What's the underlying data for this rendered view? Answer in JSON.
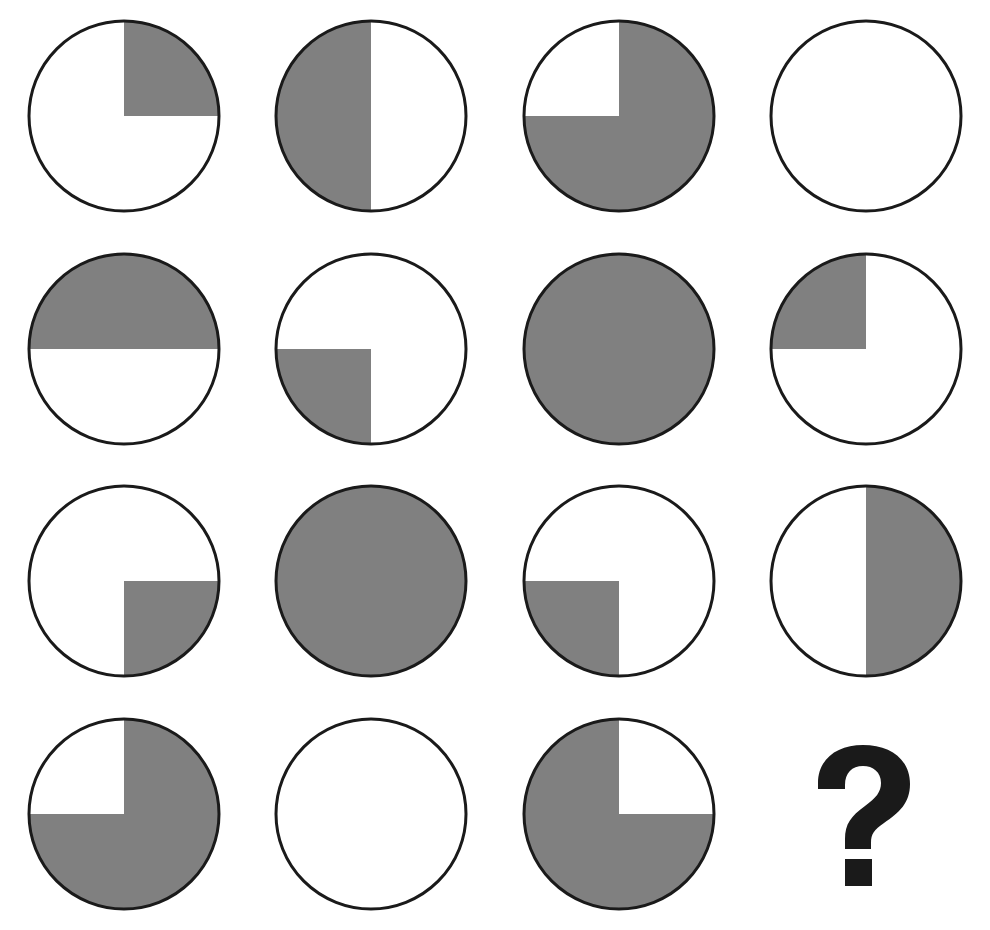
{
  "figure": {
    "type": "4x4 matrix of quartered circles with missing final element",
    "rows": 4,
    "columns": 4,
    "background_color": "#ffffff",
    "fill_color": "#808080",
    "outline_color": "#1a1a1a",
    "question_mark_color": "#1a1a1a",
    "circle_diameter_px": 190,
    "outline_width_px": 3
  },
  "legend": {
    "quadrant_order": [
      "top-left",
      "top-right",
      "bottom-right",
      "bottom-left"
    ],
    "filled_token": "filled",
    "empty_token": "empty"
  },
  "cells": [
    {
      "id": "r1c1",
      "row": 1,
      "col": 2,
      "kind": "circle",
      "label": "circle top-right quadrant shaded",
      "shaded_quadrants": [
        "top-right"
      ],
      "quadrants": {
        "top_left": false,
        "top_right": true,
        "bottom_right": false,
        "bottom_left": false
      },
      "shaded_count": 1
    },
    {
      "id": "r1c2",
      "row": 1,
      "col": 2,
      "kind": "circle",
      "label": "circle left half shaded",
      "shaded_quadrants": [
        "top-left",
        "bottom-left"
      ],
      "quadrants": {
        "top_left": true,
        "top_right": false,
        "bottom_right": false,
        "bottom_left": true
      },
      "shaded_count": 2
    },
    {
      "id": "r1c3",
      "row": 1,
      "col": 3,
      "kind": "circle",
      "label": "circle three quadrants shaded except top-left",
      "shaded_quadrants": [
        "top-right",
        "bottom-right",
        "bottom-left"
      ],
      "quadrants": {
        "top_left": false,
        "top_right": true,
        "bottom_right": true,
        "bottom_left": true
      },
      "shaded_count": 3
    },
    {
      "id": "r1c4",
      "row": 1,
      "col": 4,
      "kind": "circle",
      "label": "empty circle",
      "shaded_quadrants": [],
      "quadrants": {
        "top_left": false,
        "top_right": false,
        "bottom_right": false,
        "bottom_left": false
      },
      "shaded_count": 0
    },
    {
      "id": "r2c1",
      "row": 2,
      "col": 1,
      "kind": "circle",
      "label": "circle top half shaded",
      "shaded_quadrants": [
        "top-left",
        "top-right"
      ],
      "quadrants": {
        "top_left": true,
        "top_right": true,
        "bottom_right": false,
        "bottom_left": false
      },
      "shaded_count": 2
    },
    {
      "id": "r2c2",
      "row": 2,
      "col": 2,
      "kind": "circle",
      "label": "circle bottom-left quadrant shaded",
      "shaded_quadrants": [
        "bottom-left"
      ],
      "quadrants": {
        "top_left": false,
        "top_right": false,
        "bottom_right": false,
        "bottom_left": true
      },
      "shaded_count": 1
    },
    {
      "id": "r2c3",
      "row": 2,
      "col": 3,
      "kind": "circle",
      "label": "fully shaded circle",
      "shaded_quadrants": [
        "top-left",
        "top-right",
        "bottom-right",
        "bottom-left"
      ],
      "quadrants": {
        "top_left": true,
        "top_right": true,
        "bottom_right": true,
        "bottom_left": true
      },
      "shaded_count": 4
    },
    {
      "id": "r2c4",
      "row": 2,
      "col": 4,
      "kind": "circle",
      "label": "circle top-left quadrant shaded",
      "shaded_quadrants": [
        "top-left"
      ],
      "quadrants": {
        "top_left": true,
        "top_right": false,
        "bottom_right": false,
        "bottom_left": false
      },
      "shaded_count": 1
    },
    {
      "id": "r3c1",
      "row": 3,
      "col": 1,
      "kind": "circle",
      "label": "circle bottom-right quadrant shaded",
      "shaded_quadrants": [
        "bottom-right"
      ],
      "quadrants": {
        "top_left": false,
        "top_right": false,
        "bottom_right": true,
        "bottom_left": false
      },
      "shaded_count": 1
    },
    {
      "id": "r3c2",
      "row": 3,
      "col": 2,
      "kind": "circle",
      "label": "fully shaded circle",
      "shaded_quadrants": [
        "top-left",
        "top-right",
        "bottom-right",
        "bottom-left"
      ],
      "quadrants": {
        "top_left": true,
        "top_right": true,
        "bottom_right": true,
        "bottom_left": true
      },
      "shaded_count": 4
    },
    {
      "id": "r3c3",
      "row": 3,
      "col": 3,
      "kind": "circle",
      "label": "circle bottom-left quadrant shaded",
      "shaded_quadrants": [
        "bottom-left"
      ],
      "quadrants": {
        "top_left": false,
        "top_right": false,
        "bottom_right": false,
        "bottom_left": true
      },
      "shaded_count": 1
    },
    {
      "id": "r3c4",
      "row": 3,
      "col": 4,
      "kind": "circle",
      "label": "circle right half shaded",
      "shaded_quadrants": [
        "top-right",
        "bottom-right"
      ],
      "quadrants": {
        "top_left": false,
        "top_right": true,
        "bottom_right": true,
        "bottom_left": false
      },
      "shaded_count": 2
    },
    {
      "id": "r4c1",
      "row": 4,
      "col": 1,
      "kind": "circle",
      "label": "circle three quadrants shaded except top-left",
      "shaded_quadrants": [
        "top-right",
        "bottom-right",
        "bottom-left"
      ],
      "quadrants": {
        "top_left": false,
        "top_right": true,
        "bottom_right": true,
        "bottom_left": true
      },
      "shaded_count": 3
    },
    {
      "id": "r4c2",
      "row": 4,
      "col": 2,
      "kind": "circle",
      "label": "empty circle",
      "shaded_quadrants": [],
      "quadrants": {
        "top_left": false,
        "top_right": false,
        "bottom_right": false,
        "bottom_left": false
      },
      "shaded_count": 0
    },
    {
      "id": "r4c3",
      "row": 4,
      "col": 3,
      "kind": "circle",
      "label": "circle three quadrants shaded except top-right",
      "shaded_quadrants": [
        "top-left",
        "bottom-right",
        "bottom-left"
      ],
      "quadrants": {
        "top_left": true,
        "top_right": false,
        "bottom_right": true,
        "bottom_left": true
      },
      "shaded_count": 3
    },
    {
      "id": "r4c4",
      "row": 4,
      "col": 4,
      "kind": "question-mark",
      "label": "question mark placeholder for missing answer",
      "glyph": "?",
      "shaded_quadrants": [],
      "quadrants": {
        "top_left": false,
        "top_right": false,
        "bottom_right": false,
        "bottom_left": false
      },
      "shaded_count": 0
    }
  ]
}
